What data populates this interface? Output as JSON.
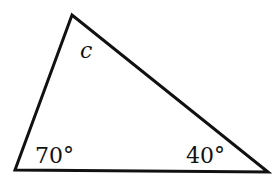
{
  "diagram": {
    "type": "triangle",
    "vertices": {
      "top": [
        72,
        15
      ],
      "bottom_left": [
        15,
        170
      ],
      "bottom_right": [
        268,
        172
      ]
    },
    "labels": {
      "top_angle": "c",
      "bottom_left_angle": "70°",
      "bottom_right_angle": "40°"
    },
    "stroke_color": "#111111"
  }
}
